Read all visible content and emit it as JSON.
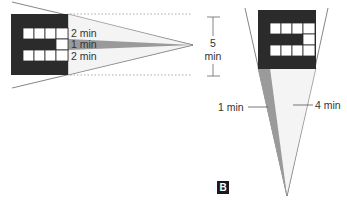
{
  "figure": {
    "panel_label": "B",
    "colors": {
      "letter_fill": "#2b2b2b",
      "cell_fill": "#ffffff",
      "cone_light": "#f4f4f4",
      "cone_dark": "#9a9a9a",
      "line": "#555555",
      "text": "#333333"
    },
    "horizontal_view": {
      "labels": {
        "top_band": "2 min",
        "middle_band": "1 min",
        "bottom_band": "2 min"
      },
      "scale": {
        "value": "5",
        "unit": "min"
      }
    },
    "vertical_view": {
      "labels": {
        "gap": "1 min",
        "total": "4 min"
      }
    }
  }
}
